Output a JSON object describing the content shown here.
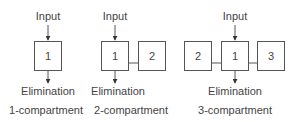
{
  "diagrams": [
    {
      "caption": "1-compartment",
      "input_label": "Input",
      "elimination_label": "Elimination",
      "compartments": [
        "1"
      ]
    },
    {
      "caption": "2-compartment",
      "input_label": "Input",
      "elimination_label": "Elimination",
      "compartments": [
        "1",
        "2"
      ]
    },
    {
      "caption": "3-compartment",
      "input_label": "Input",
      "elimination_label": "Elimination",
      "compartments": [
        "2",
        "1",
        "3"
      ]
    }
  ],
  "colors": {
    "stroke": "#555555",
    "text": "#444444"
  }
}
